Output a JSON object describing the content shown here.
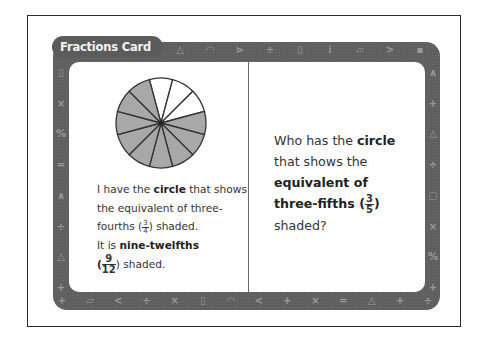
{
  "card": {
    "title": "Fractions Card"
  },
  "left_side": {
    "pie": {
      "segments": 12,
      "shaded": 9,
      "unshaded": 3,
      "shaded_color": "#a8a8a8",
      "unshaded_color": "#ffffff"
    },
    "line1_pre": "I have the ",
    "line1_bold": "circle",
    "line1_post": " that shows the equivalent of three-fourths (",
    "frac1_num": "3",
    "frac1_den": "4",
    "line1_end": ") shaded.",
    "line2_pre": "It is ",
    "line2_bold": "nine-twelfths",
    "frac2_open": "(",
    "frac2_num": "9",
    "frac2_den": "12",
    "line2_end": ") shaded."
  },
  "right_side": {
    "pre": "Who has the ",
    "bold1": "circle",
    "mid": " that shows the ",
    "bold2": "equivalent of three-fifths",
    "open": " (",
    "frac_num": "3",
    "frac_den": "5",
    "close": ")",
    "end": " shaded?"
  },
  "border_symbols": {
    "top": [
      "+",
      "△",
      "◠",
      "⋗",
      "÷",
      "▯",
      "⁞",
      "▱",
      ">",
      "▪"
    ],
    "bottom": [
      "+",
      "▱",
      "<",
      "÷",
      "×",
      "▯",
      "◠",
      "<",
      "+",
      "×",
      "=",
      "△",
      "+",
      "÷"
    ],
    "left": [
      "▯",
      "×",
      "%",
      "=",
      "∧",
      "÷",
      "△",
      "+"
    ],
    "right": [
      "∧",
      "+",
      "△",
      "÷",
      "▢",
      "×",
      "%",
      "+"
    ]
  }
}
